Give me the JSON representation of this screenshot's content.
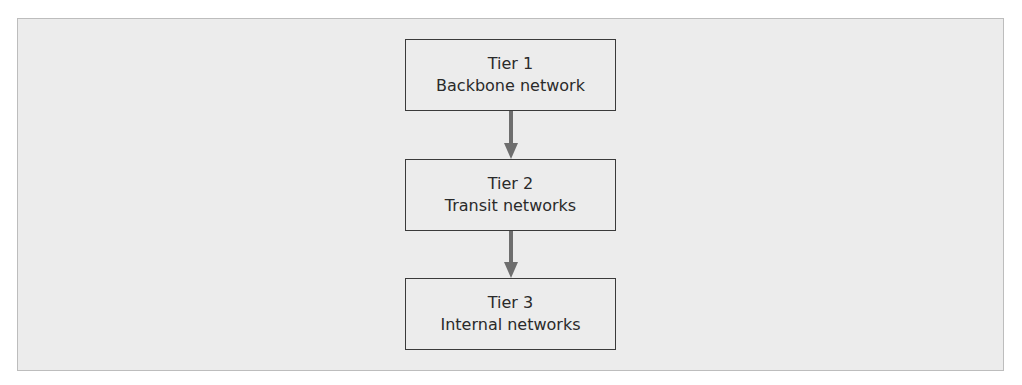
{
  "diagram": {
    "nodes": [
      {
        "id": "tier1",
        "title": "Tier 1",
        "subtitle": "Backbone network"
      },
      {
        "id": "tier2",
        "title": "Tier 2",
        "subtitle": "Transit networks"
      },
      {
        "id": "tier3",
        "title": "Tier 3",
        "subtitle": "Internal networks"
      }
    ],
    "edges": [
      {
        "from": "tier1",
        "to": "tier2"
      },
      {
        "from": "tier2",
        "to": "tier3"
      }
    ],
    "colors": {
      "arrow": "#6e6e6e",
      "box_border": "#3a3a3a",
      "background": "#ececec"
    }
  }
}
